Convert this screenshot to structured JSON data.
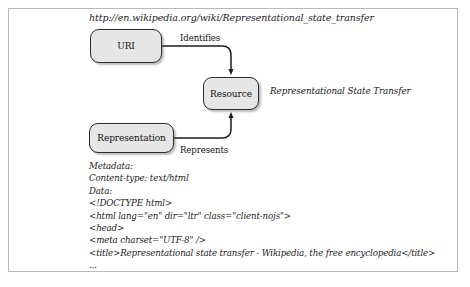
{
  "figure": {
    "url": "http://en.wikipedia.org/wiki/Representational_state_transfer",
    "annotation": "Representational State Transfer"
  },
  "nodes": [
    {
      "id": "uri",
      "label": "URI"
    },
    {
      "id": "resource",
      "label": "Resource"
    },
    {
      "id": "representation",
      "label": "Representation"
    }
  ],
  "edges": [
    {
      "id": "identifies",
      "label": "Identifies",
      "from": "uri",
      "to": "resource"
    },
    {
      "id": "represents",
      "label": "Represents",
      "from": "representation",
      "to": "resource"
    }
  ],
  "payload": {
    "lines": [
      "Metadata:",
      "Content-type: text/html",
      "Data:",
      "<!DOCTYPE html>",
      "<html lang=\"en\" dir=\"ltr\" class=\"client-nojs\">",
      "<head>",
      "<meta charset=\"UTF-8\" />",
      "<title>Representational state transfer - Wikipedia, the free encyclopedia</title>",
      "..."
    ]
  },
  "colors": {
    "node_fill": "#e6e6e6",
    "node_stroke": "#2b2b2b",
    "frame_stroke": "#b9b9b9",
    "background": "#ffffff",
    "text": "#1b1b1b"
  }
}
